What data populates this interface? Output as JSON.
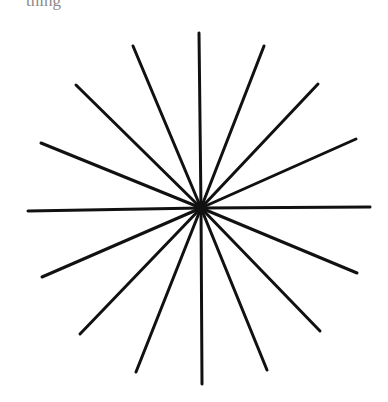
{
  "header": {
    "clipped_text": "thing"
  },
  "diagram": {
    "type": "starburst",
    "center": [
      201,
      208
    ],
    "stroke_color": "#111111",
    "stroke_width": 3,
    "ray_endpoints": [
      [
        199,
        33
      ],
      [
        264,
        46
      ],
      [
        318,
        84
      ],
      [
        356,
        139
      ],
      [
        370,
        207
      ],
      [
        357,
        273
      ],
      [
        320,
        331
      ],
      [
        267,
        370
      ],
      [
        202,
        384
      ],
      [
        136,
        372
      ],
      [
        80,
        334
      ],
      [
        42,
        277
      ],
      [
        28,
        211
      ],
      [
        41,
        143
      ],
      [
        76,
        85
      ],
      [
        133,
        46
      ]
    ]
  }
}
